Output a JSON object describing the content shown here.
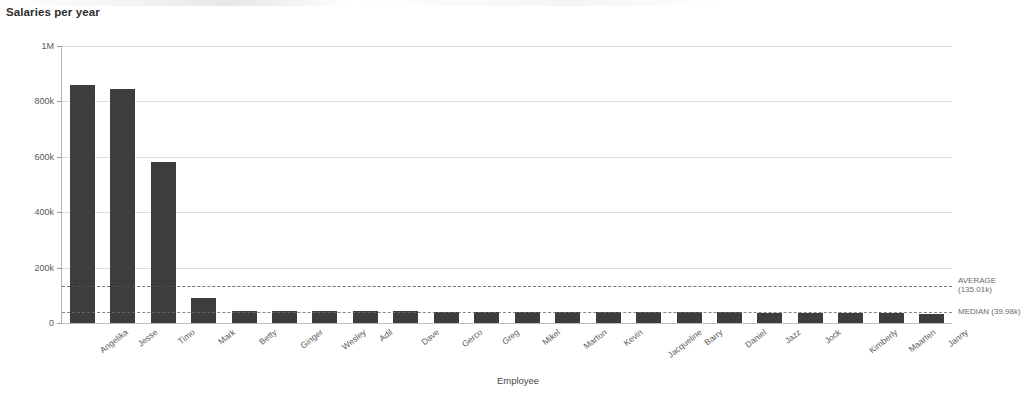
{
  "chart_title": "Salaries per year",
  "chart_data": {
    "type": "bar",
    "title": "Salaries per year",
    "xlabel": "Employee",
    "ylabel": "Sum(Salary)",
    "ylim": [
      0,
      1000000
    ],
    "grid": true,
    "legend_position": "none",
    "ytick_labels": [
      "1M",
      "800k",
      "600k",
      "400k",
      "200k",
      "0"
    ],
    "ytick_values": [
      1000000,
      800000,
      600000,
      400000,
      200000,
      0
    ],
    "categories": [
      "Angelika",
      "Jesse",
      "Timo",
      "Mark",
      "Betty",
      "Ginger",
      "Wesley",
      "Adil",
      "Dave",
      "Gerco",
      "Greg",
      "Mikel",
      "Marton",
      "Kevin",
      "Jacqueline",
      "Barry",
      "Daniel",
      "Jazz",
      "Jock",
      "Kimberly",
      "Maarten",
      "Janny"
    ],
    "values": [
      859000,
      844000,
      580000,
      91000,
      44000,
      44000,
      43000,
      43000,
      42000,
      41000,
      41000,
      41000,
      40000,
      40000,
      39000,
      38000,
      38000,
      37000,
      36000,
      36000,
      35000,
      34000
    ],
    "reference_lines": [
      {
        "name": "AVERAGE",
        "value": 135010,
        "label_line1": "AVERAGE",
        "label_line2": "(135.01k)",
        "style": "dashed"
      },
      {
        "name": "MEDIAN",
        "value": 39980,
        "label_line1": "MEDIAN (39.98k)",
        "label_line2": "",
        "style": "dashed"
      }
    ],
    "bar_color": "#3d3d3d",
    "gridline_color": "#dcdcdc",
    "reference_line_color": "#555555"
  },
  "ghost_text": {
    "line1": "",
    "line2": "",
    "line3": ""
  }
}
